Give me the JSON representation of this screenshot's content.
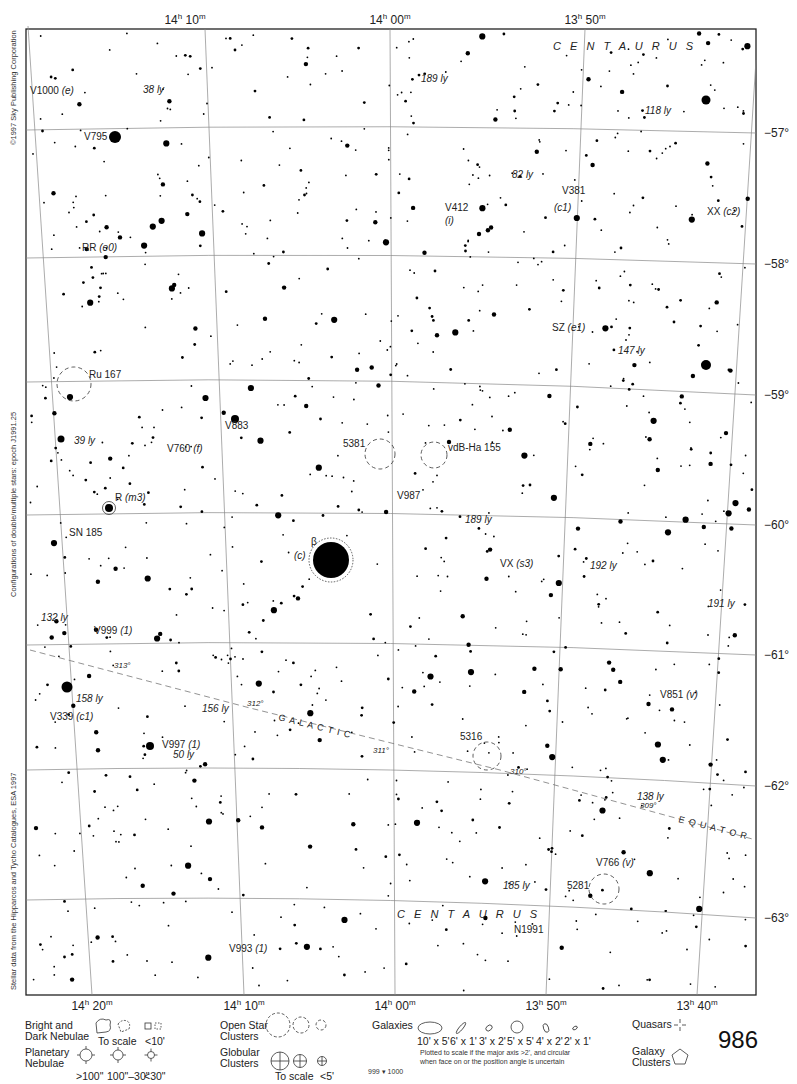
{
  "chart_data": {
    "type": "star-atlas-chart",
    "constellation": "CENTAURUS",
    "page_number": "986",
    "adjacent_pages": [
      "999",
      "1000"
    ],
    "ra_axis": {
      "top_labels": [
        "14h 10m",
        "14h 00m",
        "13h 50m"
      ],
      "bottom_labels": [
        "14h 20m",
        "14h 10m",
        "14h 00m",
        "13h 50m",
        "13h 40m"
      ]
    },
    "dec_axis": {
      "labels": [
        "-57°",
        "-58°",
        "-59°",
        "-60°",
        "-61°",
        "-62°",
        "-63°"
      ]
    },
    "galactic_equator": {
      "label": "GALACTIC EQUATOR",
      "longitudes": [
        "313°",
        "312°",
        "311°",
        "310°",
        "309°"
      ]
    },
    "objects": [
      {
        "name": "V1000 (e)",
        "type": "variable star"
      },
      {
        "name": "V795",
        "type": "variable star"
      },
      {
        "name": "RR (e0)",
        "type": "variable star"
      },
      {
        "name": "Ru 167",
        "type": "open cluster"
      },
      {
        "name": "V883",
        "type": "variable star"
      },
      {
        "name": "V760 (f)",
        "type": "variable star"
      },
      {
        "name": "R (m3)",
        "type": "variable star"
      },
      {
        "name": "SN 185",
        "type": "supernova remnant"
      },
      {
        "name": "V999 (1)",
        "type": "variable star"
      },
      {
        "name": "V339 (c1)",
        "type": "variable star"
      },
      {
        "name": "V997 (1)",
        "type": "variable star"
      },
      {
        "name": "V993 (1)",
        "type": "variable star"
      },
      {
        "name": "β (c)",
        "type": "bright star"
      },
      {
        "name": "5381",
        "type": "open cluster"
      },
      {
        "name": "vdB-Ha 155",
        "type": "open cluster"
      },
      {
        "name": "V987",
        "type": "variable star"
      },
      {
        "name": "V412 (i)",
        "type": "variable star"
      },
      {
        "name": "V381 (c1)",
        "type": "variable star"
      },
      {
        "name": "XX (c2)",
        "type": "variable star"
      },
      {
        "name": "SZ (e1)",
        "type": "variable star"
      },
      {
        "name": "VX (s3)",
        "type": "variable star"
      },
      {
        "name": "5316",
        "type": "open cluster"
      },
      {
        "name": "V851 (v)",
        "type": "variable star"
      },
      {
        "name": "V766 (v)",
        "type": "variable star"
      },
      {
        "name": "5281",
        "type": "open cluster"
      },
      {
        "name": "N1991",
        "type": "nova"
      }
    ],
    "distance_labels": [
      "38 ly",
      "189 ly",
      "118 ly",
      "82 ly",
      "147 ly",
      "39 ly",
      "189 ly",
      "192 ly",
      "191 ly",
      "132 ly",
      "158 ly",
      "156 ly",
      "50 ly",
      "138 ly",
      "185 ly"
    ]
  },
  "header": {
    "ra_top": [
      {
        "h": "14",
        "m": "10",
        "x": 185
      },
      {
        "h": "14",
        "m": "00",
        "x": 390
      },
      {
        "h": "13",
        "m": "50",
        "x": 585
      }
    ],
    "constellation_top": "C E N T A U R U S"
  },
  "footer": {
    "ra_bottom": [
      {
        "h": "14",
        "m": "20",
        "x": 60
      },
      {
        "h": "14",
        "m": "10",
        "x": 158
      },
      {
        "h": "14",
        "m": "00",
        "x": 258
      },
      {
        "h": "13",
        "m": "50",
        "x": 357
      },
      {
        "h": "13",
        "m": "40",
        "x": 456
      }
    ],
    "constellation_bottom": "C E N T A U R U S"
  },
  "dec_labels": [
    {
      "text": "−57°",
      "y": 133
    },
    {
      "text": "−58°",
      "y": 264
    },
    {
      "text": "−59°",
      "y": 395
    },
    {
      "text": "−60°",
      "y": 525
    },
    {
      "text": "−61°",
      "y": 655
    },
    {
      "text": "−62°",
      "y": 786
    },
    {
      "text": "−63°",
      "y": 918
    }
  ],
  "credits": {
    "copyright": "©1997 Sky Publishing Corporation",
    "epoch": "Configurations of double/multiple stars: epoch J1991.25",
    "source": "Stellar data from the Hipparcos and Tycho Catalogues, ESA 1997"
  },
  "labels": [
    {
      "t": "V1000",
      "i": "(e)",
      "x": 30,
      "y": 94
    },
    {
      "t": "",
      "i": "38 ly",
      "x": 143,
      "y": 93
    },
    {
      "t": "",
      "i": "189 ly",
      "x": 421,
      "y": 82
    },
    {
      "t": "",
      "i": "118 ly",
      "x": 645,
      "y": 114
    },
    {
      "t": "V795",
      "i": "",
      "x": 84,
      "y": 140
    },
    {
      "t": "",
      "i": "82 ly",
      "x": 512,
      "y": 178
    },
    {
      "t": "V381",
      "i": "",
      "x": 562,
      "y": 194
    },
    {
      "t": "",
      "i": "(c1)",
      "x": 554,
      "y": 211
    },
    {
      "t": "V412",
      "i": "",
      "x": 445,
      "y": 211
    },
    {
      "t": "",
      "i": "(i)",
      "x": 445,
      "y": 224
    },
    {
      "t": "XX",
      "i": "(c2)",
      "x": 707,
      "y": 215
    },
    {
      "t": "RR",
      "i": "(e0)",
      "x": 82,
      "y": 251
    },
    {
      "t": "SZ",
      "i": "(e1)",
      "x": 552,
      "y": 331
    },
    {
      "t": "",
      "i": "147 ly",
      "x": 618,
      "y": 354
    },
    {
      "t": "Ru 167",
      "i": "",
      "x": 89,
      "y": 378
    },
    {
      "t": "V883",
      "i": "",
      "x": 225,
      "y": 429
    },
    {
      "t": "",
      "i": "39 ly",
      "x": 74,
      "y": 444
    },
    {
      "t": "V760",
      "i": "(f)",
      "x": 167,
      "y": 452
    },
    {
      "t": "5381",
      "i": "",
      "x": 343,
      "y": 447
    },
    {
      "t": "vdB-Ha 155",
      "i": "",
      "x": 448,
      "y": 451
    },
    {
      "t": "V987",
      "i": "",
      "x": 397,
      "y": 499
    },
    {
      "t": "R",
      "i": "(m3)",
      "x": 115,
      "y": 501
    },
    {
      "t": "",
      "i": "189 ly",
      "x": 465,
      "y": 523
    },
    {
      "t": "SN 185",
      "i": "",
      "x": 69,
      "y": 536
    },
    {
      "t": "β",
      "i": "",
      "x": 311,
      "y": 545
    },
    {
      "t": "",
      "i": "(c)",
      "x": 294,
      "y": 559
    },
    {
      "t": "VX",
      "i": "(s3)",
      "x": 500,
      "y": 567
    },
    {
      "t": "",
      "i": "192 ly",
      "x": 590,
      "y": 569
    },
    {
      "t": "",
      "i": "191 ly",
      "x": 708,
      "y": 607
    },
    {
      "t": "",
      "i": "132 ly",
      "x": 41,
      "y": 621
    },
    {
      "t": "V999",
      "i": "(1)",
      "x": 94,
      "y": 634
    },
    {
      "t": "",
      "i": "158 ly",
      "x": 76,
      "y": 702
    },
    {
      "t": "V339",
      "i": "(c1)",
      "x": 50,
      "y": 720
    },
    {
      "t": "",
      "i": "156 ly",
      "x": 202,
      "y": 712
    },
    {
      "t": "V851",
      "i": "(v)",
      "x": 660,
      "y": 698
    },
    {
      "t": "5316",
      "i": "",
      "x": 460,
      "y": 740
    },
    {
      "t": "V997",
      "i": "(1)",
      "x": 162,
      "y": 748
    },
    {
      "t": "",
      "i": "50 ly",
      "x": 173,
      "y": 758
    },
    {
      "t": "",
      "i": "138 ly",
      "x": 637,
      "y": 800
    },
    {
      "t": "V766",
      "i": "(v)",
      "x": 596,
      "y": 866
    },
    {
      "t": "",
      "i": "185 ly",
      "x": 503,
      "y": 889
    },
    {
      "t": "5281",
      "i": "",
      "x": 567,
      "y": 889
    },
    {
      "t": "N1991",
      "i": "",
      "x": 514,
      "y": 933
    },
    {
      "t": "V993",
      "i": "(1)",
      "x": 229,
      "y": 952
    }
  ],
  "galactic_labels": [
    {
      "t": "313°",
      "x": 114,
      "y": 668
    },
    {
      "t": "312°",
      "x": 247,
      "y": 706
    },
    {
      "t": "311°",
      "x": 373,
      "y": 753
    },
    {
      "t": "310°",
      "x": 510,
      "y": 774
    },
    {
      "t": "309°",
      "x": 640,
      "y": 808
    }
  ],
  "galactic_words": [
    {
      "t": "G A L A C T I C",
      "x": 278,
      "y": 720,
      "rot": 14
    },
    {
      "t": "E Q U A T O R",
      "x": 678,
      "y": 822,
      "rot": 14
    }
  ],
  "legend": {
    "nebulae_bright_dark": "Bright and Dark Nebulae",
    "nebulae_to_scale": "To scale",
    "nebulae_small": "<10'",
    "planetary_nebulae": "Planetary Nebulae",
    "planetary_sizes": [
      ">100\"",
      "100\"–30\"",
      "<30\""
    ],
    "open_clusters": "Open Star Clusters",
    "globular_clusters": "Globular Clusters",
    "globular_to_scale": "To scale",
    "globular_small": "<5'",
    "galaxies": "Galaxies",
    "galaxy_sizes": [
      "10' x 5'",
      "6' x 1'",
      "3' x 2'",
      "5' x 5'",
      "4' x 2'",
      "2' x 1'"
    ],
    "galaxy_note_1": "Plotted to scale if the major axis >2', and circular",
    "galaxy_note_2": "when face on or the position angle is uncertain",
    "quasars": "Quasars",
    "galaxy_clusters": "Galaxy Clusters",
    "adjacent_left": "999",
    "adjacent_right": "1000"
  }
}
